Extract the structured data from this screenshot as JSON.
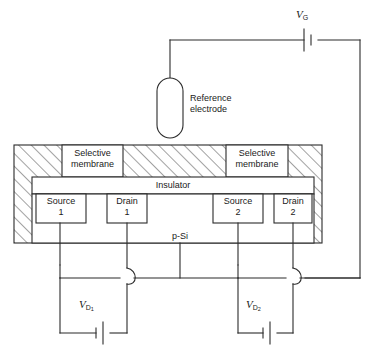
{
  "figure": {
    "type": "schematic-diagram",
    "line_color": "#2b2b2b",
    "background_color": "#ffffff",
    "hatch_color": "#555555"
  },
  "labels": {
    "reference_electrode": "Reference\nelectrode",
    "reference_electrode_line1": "Reference",
    "reference_electrode_line2": "electrode",
    "selective_membrane_1_line1": "Selective",
    "selective_membrane_1_line2": "membrane",
    "selective_membrane_2_line1": "Selective",
    "selective_membrane_2_line2": "membrane",
    "insulator": "Insulator",
    "substrate": "p-Si",
    "source_1_line1": "Source",
    "source_1_line2": "1",
    "drain_1_line1": "Drain",
    "drain_1_line2": "1",
    "source_2_line1": "Source",
    "source_2_line2": "2",
    "drain_2_line1": "Drain",
    "drain_2_line2": "2"
  },
  "sources": {
    "gate": {
      "symbol": "V",
      "subscript": "G",
      "name": "gate voltage source"
    },
    "drain_1": {
      "symbol": "V",
      "subscript": "D",
      "subsubscript": "1",
      "name": "drain 1 voltage source"
    },
    "drain_2": {
      "symbol": "V",
      "subscript": "D",
      "subsubscript": "2",
      "name": "drain 2 voltage source"
    }
  },
  "components": [
    {
      "id": "reference-electrode",
      "kind": "capsule",
      "label": "Reference electrode"
    },
    {
      "id": "selective-membrane-1",
      "kind": "region",
      "label": "Selective membrane"
    },
    {
      "id": "selective-membrane-2",
      "kind": "region",
      "label": "Selective membrane"
    },
    {
      "id": "insulator",
      "kind": "layer",
      "label": "Insulator"
    },
    {
      "id": "p-si-substrate",
      "kind": "layer",
      "label": "p-Si"
    },
    {
      "id": "source-1",
      "kind": "terminal",
      "label": "Source 1"
    },
    {
      "id": "drain-1",
      "kind": "terminal",
      "label": "Drain 1"
    },
    {
      "id": "source-2",
      "kind": "terminal",
      "label": "Source 2"
    },
    {
      "id": "drain-2",
      "kind": "terminal",
      "label": "Drain 2"
    },
    {
      "id": "battery-vg",
      "kind": "battery",
      "label": "VG"
    },
    {
      "id": "battery-vd1",
      "kind": "battery",
      "label": "VD1"
    },
    {
      "id": "battery-vd2",
      "kind": "battery",
      "label": "VD2"
    }
  ]
}
